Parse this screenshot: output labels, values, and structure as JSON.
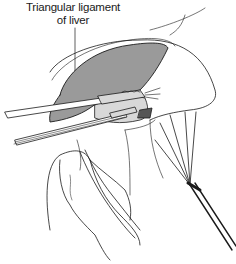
{
  "figure": {
    "callouts": [
      {
        "line1": "Triangular ligament",
        "line2": "of liver"
      }
    ]
  },
  "colors": {
    "ink": "#1a1a1a",
    "liver_fill": "#9a9a9a",
    "instrument_fill": "#d8d8d8",
    "background": "#ffffff"
  }
}
